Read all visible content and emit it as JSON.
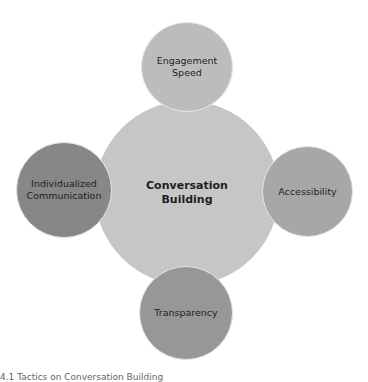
{
  "diagram": {
    "type": "central-hub with satellites",
    "center": {
      "label_line1": "Conversation",
      "label_line2": "Building",
      "color": "#c6c6c6"
    },
    "satellites": [
      {
        "position": "top",
        "label_line1": "Engagement",
        "label_line2": "Speed",
        "color": "#bcbcbc"
      },
      {
        "position": "right",
        "label_line1": "Accessibility",
        "label_line2": "",
        "color": "#a7a7a7"
      },
      {
        "position": "bottom",
        "label_line1": "Transparency",
        "label_line2": "",
        "color": "#979797"
      },
      {
        "position": "left",
        "label_line1": "Individualized",
        "label_line2": "Communication",
        "color": "#878787"
      }
    ]
  },
  "caption": "4.1 Tactics on Conversation Building"
}
